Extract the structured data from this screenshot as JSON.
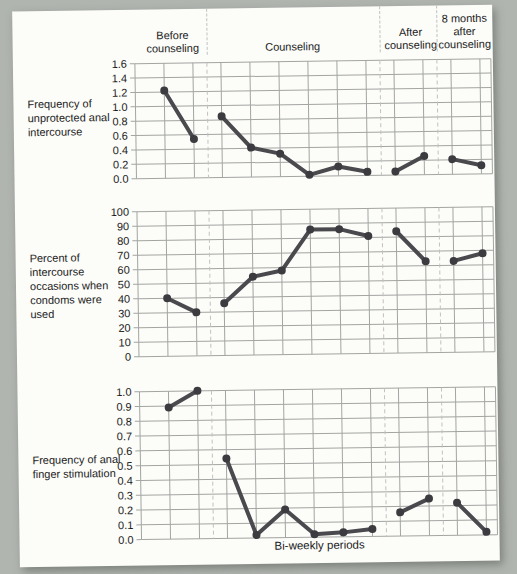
{
  "figure": {
    "xlabel": "Bi-weekly periods",
    "phase_labels": [
      "Before\ncounseling",
      "Counseling",
      "After\ncounseling",
      "8 months\nafter\ncounseling"
    ],
    "row_labels": [
      "Frequency of\nunprotected anal\nintercourse",
      "Percent of\nintercourse\noccasions when\ncondoms were\nused",
      "Frequency of anal\nfinger stimulation"
    ]
  },
  "layout": {
    "plot_left": 122,
    "plot_width": 356,
    "point_spacing": 29,
    "boundary_spacing": 28,
    "phase_boundaries_after": [
      2,
      8,
      10
    ],
    "plot_heights": [
      115,
      145,
      148
    ],
    "chart_tops": [
      46,
      194,
      374
    ],
    "colors": {
      "page_bg": "#b1b5b0",
      "card_bg": "#fcfcf9",
      "grid": "#a2a5a1",
      "dashed": "#c0c2bf",
      "line": "#4a4a4e",
      "point": "#3c3c40",
      "text": "#1b1b1b"
    }
  },
  "chart_data": [
    {
      "type": "line",
      "title": "Frequency of unprotected anal intercourse",
      "xlabel": "",
      "ylabel": "",
      "ylim": [
        0,
        1.6
      ],
      "ytick_labels": [
        "1.6",
        "1.4",
        "1.2",
        "1.0",
        "0.8",
        "0.6",
        "0.4",
        "0.2",
        "0.0"
      ],
      "grid": true,
      "categories": [
        1,
        2,
        3,
        4,
        5,
        6,
        7,
        8,
        9,
        10,
        11,
        12
      ],
      "series": [
        {
          "name": "Before counseling",
          "points": [
            1,
            2
          ],
          "values": [
            1.22,
            0.54
          ]
        },
        {
          "name": "Counseling",
          "points": [
            3,
            4,
            5,
            6,
            7,
            8
          ],
          "values": [
            0.85,
            0.41,
            0.32,
            0.02,
            0.13,
            0.05
          ]
        },
        {
          "name": "After counseling",
          "points": [
            9,
            10
          ],
          "values": [
            0.05,
            0.26
          ]
        },
        {
          "name": "8 months after counseling",
          "points": [
            11,
            12
          ],
          "values": [
            0.21,
            0.12
          ]
        }
      ]
    },
    {
      "type": "line",
      "title": "Percent of intercourse occasions when condoms were used",
      "xlabel": "",
      "ylabel": "",
      "ylim": [
        0,
        100
      ],
      "ytick_labels": [
        "100",
        "90",
        "80",
        "70",
        "60",
        "50",
        "40",
        "30",
        "20",
        "10",
        "0"
      ],
      "grid": true,
      "categories": [
        1,
        2,
        3,
        4,
        5,
        6,
        7,
        8,
        9,
        10,
        11,
        12
      ],
      "series": [
        {
          "name": "Before counseling",
          "points": [
            1,
            2
          ],
          "values": [
            40,
            30
          ]
        },
        {
          "name": "Counseling",
          "points": [
            3,
            4,
            5,
            6,
            7,
            8
          ],
          "values": [
            36,
            54,
            58,
            86,
            86,
            81
          ]
        },
        {
          "name": "After counseling",
          "points": [
            9,
            10
          ],
          "values": [
            84,
            63
          ]
        },
        {
          "name": "8 months after counseling",
          "points": [
            11,
            12
          ],
          "values": [
            63,
            68
          ]
        }
      ]
    },
    {
      "type": "line",
      "title": "Frequency of anal finger stimulation",
      "xlabel": "Bi-weekly periods",
      "ylabel": "",
      "ylim": [
        0,
        1.0
      ],
      "ytick_labels": [
        "1.0",
        "0.9",
        "0.8",
        "0.7",
        "0.6",
        "0.5",
        "0.4",
        "0.3",
        "0.2",
        "0.1",
        "0.0"
      ],
      "grid": true,
      "categories": [
        1,
        2,
        3,
        4,
        5,
        6,
        7,
        8,
        9,
        10,
        11,
        12
      ],
      "series": [
        {
          "name": "Before counseling",
          "points": [
            1,
            2
          ],
          "values": [
            0.89,
            1.0
          ]
        },
        {
          "name": "Counseling",
          "points": [
            3,
            4,
            5,
            6,
            7,
            8
          ],
          "values": [
            0.54,
            0.02,
            0.19,
            0.02,
            0.03,
            0.05
          ]
        },
        {
          "name": "After counseling",
          "points": [
            9,
            10
          ],
          "values": [
            0.16,
            0.25
          ]
        },
        {
          "name": "8 months after counseling",
          "points": [
            11,
            12
          ],
          "values": [
            0.22,
            0.02
          ]
        }
      ]
    }
  ]
}
